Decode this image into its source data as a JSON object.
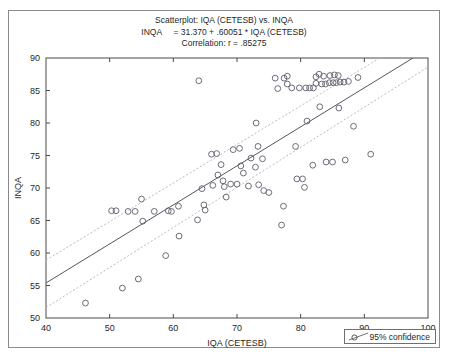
{
  "figure": {
    "title_lines": [
      "Scatterplot: IQA (CETESB) vs. INQA",
      "INQA     = 31.370 + .60051 * IQA (CETESB)",
      "Correlation: r = .85275"
    ],
    "legend": {
      "label": "95% confidence",
      "marker_icon": "line-with-circle-marker-icon"
    },
    "colors": {
      "frame": "#8a8a8a",
      "axis": "#4a4a4a",
      "marker": "#6b6b78",
      "fit_line": "#55555f",
      "confidence_band": "#b9b9c4",
      "text": "#1f1f1f"
    }
  },
  "chart_data": {
    "type": "scatter",
    "title": "Scatterplot: IQA (CETESB) vs. INQA",
    "subtitle": "INQA     = 31.370 + .60051 * IQA (CETESB)",
    "annotation": "Correlation: r = .85275",
    "xlabel": "IQA (CETESB)",
    "ylabel": "INQA",
    "xlim": [
      40,
      100
    ],
    "ylim": [
      50,
      90
    ],
    "xticks": [
      40,
      50,
      60,
      70,
      80,
      90,
      100
    ],
    "yticks": [
      50,
      55,
      60,
      65,
      70,
      75,
      80,
      85,
      90
    ],
    "grid": false,
    "legend_position": "bottom-right",
    "regression": {
      "intercept": 31.37,
      "slope": 0.60051,
      "r": 0.85275,
      "label": "INQA = 31.370 + .60051 * IQA (CETESB)"
    },
    "confidence": {
      "level": 0.95,
      "label": "95% confidence",
      "upper_at_xmin": 58.9,
      "lower_at_xmin": 51.6,
      "upper_at_xmax": 94.5,
      "lower_at_xmax": 88.6
    },
    "series": [
      {
        "name": "observations",
        "marker": "open-circle",
        "points": [
          [
            46.2,
            52.3
          ],
          [
            50.3,
            66.5
          ],
          [
            51.0,
            66.5
          ],
          [
            52.0,
            54.6
          ],
          [
            52.9,
            66.4
          ],
          [
            54.0,
            66.4
          ],
          [
            54.5,
            56.0
          ],
          [
            55.0,
            68.3
          ],
          [
            55.2,
            64.9
          ],
          [
            57.0,
            66.4
          ],
          [
            58.8,
            59.6
          ],
          [
            59.2,
            66.5
          ],
          [
            59.7,
            66.4
          ],
          [
            60.8,
            67.2
          ],
          [
            60.9,
            62.6
          ],
          [
            63.8,
            65.1
          ],
          [
            64.0,
            86.5
          ],
          [
            64.5,
            69.9
          ],
          [
            64.8,
            67.4
          ],
          [
            65.0,
            66.6
          ],
          [
            66.0,
            75.2
          ],
          [
            66.8,
            75.3
          ],
          [
            66.2,
            70.4
          ],
          [
            67.0,
            72.0
          ],
          [
            67.5,
            73.6
          ],
          [
            67.8,
            71.1
          ],
          [
            68.0,
            70.2
          ],
          [
            68.3,
            68.6
          ],
          [
            69.0,
            70.6
          ],
          [
            70.0,
            70.6
          ],
          [
            69.4,
            75.9
          ],
          [
            70.4,
            76.1
          ],
          [
            70.6,
            73.4
          ],
          [
            71.0,
            72.3
          ],
          [
            71.8,
            70.3
          ],
          [
            72.2,
            74.6
          ],
          [
            72.9,
            73.2
          ],
          [
            73.0,
            80.0
          ],
          [
            73.3,
            76.4
          ],
          [
            73.4,
            70.5
          ],
          [
            74.0,
            74.5
          ],
          [
            74.2,
            69.6
          ],
          [
            75.0,
            69.3
          ],
          [
            76.0,
            86.9
          ],
          [
            77.4,
            86.9
          ],
          [
            76.4,
            85.3
          ],
          [
            77.0,
            64.3
          ],
          [
            77.3,
            67.2
          ],
          [
            77.9,
            87.2
          ],
          [
            77.9,
            86.0
          ],
          [
            78.6,
            85.4
          ],
          [
            79.2,
            76.4
          ],
          [
            79.4,
            71.4
          ],
          [
            80.3,
            71.4
          ],
          [
            79.8,
            85.4
          ],
          [
            80.8,
            85.4
          ],
          [
            80.6,
            70.1
          ],
          [
            81.0,
            80.3
          ],
          [
            81.4,
            85.4
          ],
          [
            82.0,
            85.4
          ],
          [
            81.9,
            73.5
          ],
          [
            82.4,
            87.1
          ],
          [
            82.4,
            86.1
          ],
          [
            82.9,
            87.5
          ],
          [
            83.0,
            82.5
          ],
          [
            83.3,
            86.0
          ],
          [
            83.9,
            86.0
          ],
          [
            83.6,
            87.2
          ],
          [
            84.0,
            74.0
          ],
          [
            85.0,
            74.0
          ],
          [
            84.5,
            86.2
          ],
          [
            84.6,
            87.3
          ],
          [
            85.1,
            86.2
          ],
          [
            85.6,
            86.2
          ],
          [
            85.3,
            87.4
          ],
          [
            85.9,
            87.3
          ],
          [
            86.0,
            82.3
          ],
          [
            86.2,
            86.3
          ],
          [
            86.8,
            86.3
          ],
          [
            87.0,
            74.3
          ],
          [
            87.5,
            86.4
          ],
          [
            88.3,
            79.5
          ],
          [
            89.0,
            87.0
          ],
          [
            91.0,
            75.2
          ]
        ]
      }
    ]
  }
}
